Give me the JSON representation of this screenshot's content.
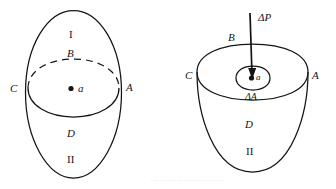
{
  "figure": {
    "title": "",
    "background_color": "#ffffff",
    "stroke_color": "#141414",
    "panels": [
      {
        "name": "left-closed-surface",
        "description": "closed oval surface with equatorial ellipse, dashed far arc",
        "labels": {
          "region_top_roman": "I",
          "region_upper_cap": "B",
          "vertex_left": "C",
          "point": "a",
          "vertex_right": "A",
          "region_lower_cap": "D",
          "region_bottom_roman": "II"
        }
      },
      {
        "name": "right-open-cup",
        "description": "cup shaped surface with rim ellipse, inner small ellipse and downward arrow",
        "labels": {
          "flux_arrow": "ΔP",
          "region_upper_cap": "B",
          "vertex_left": "C",
          "point": "a",
          "vertex_right": "A",
          "area_element": "ΔA",
          "region_lower_cap": "D",
          "region_bottom_roman": "II"
        }
      }
    ]
  },
  "caption": {
    "ghost_text": "· ·· ·· · ···· ·· ···· ···· ··· ····· ·"
  }
}
